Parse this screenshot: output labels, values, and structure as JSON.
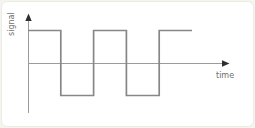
{
  "figure": {
    "type": "signal-plot"
  },
  "colors": {
    "background": "#ffffff",
    "page_background": "#f6f4ee",
    "card_border": "#ecebe4",
    "axis_line": "#9b9b9b",
    "arrowhead": "#2f2f2f",
    "wave_line": "#878787",
    "label_text": "#6e6e6e"
  },
  "chart_data": {
    "type": "line",
    "subtype": "square-wave",
    "title": "",
    "xlabel": "time",
    "ylabel": "signal",
    "x_axis": {
      "arrow": true,
      "ticks": [],
      "grid": false
    },
    "y_axis": {
      "arrow": true,
      "ticks": [],
      "grid": false
    },
    "amplitude": 1,
    "half_period": 1,
    "series": [
      {
        "name": "signal",
        "points": [
          [
            0,
            1
          ],
          [
            1,
            1
          ],
          [
            1,
            -1
          ],
          [
            2,
            -1
          ],
          [
            2,
            1
          ],
          [
            3,
            1
          ],
          [
            3,
            -1
          ],
          [
            4,
            -1
          ],
          [
            4,
            1
          ],
          [
            5,
            1
          ]
        ]
      }
    ]
  }
}
